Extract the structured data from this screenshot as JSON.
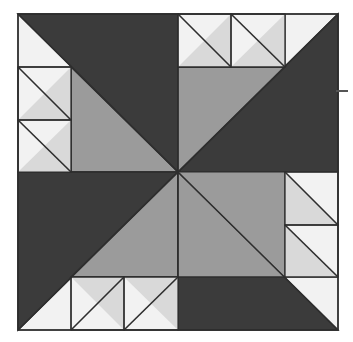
{
  "figure": {
    "type": "quilt-block-diagram",
    "canvas": {
      "width": 353,
      "height": 342,
      "background": "#ffffff"
    },
    "block": {
      "x": 18,
      "y": 14,
      "width": 320,
      "height": 316,
      "grid_rows": 4,
      "grid_cols": 4,
      "cell_width": 80,
      "cell_height": 79
    },
    "center_point": {
      "x": 178,
      "y": 172
    },
    "symmetry": "4-fold rotational (pinwheel)"
  },
  "colors": {
    "dark": "#3b3b3b",
    "medium": "#9b9b9b",
    "light": "#f2f2f2",
    "light_gray": "#d9d9d9",
    "outline": "#2e2e2e",
    "background": "#ffffff",
    "tick_mark": "#555555"
  },
  "legend": {
    "dark_label": "Dark fabric",
    "medium_label": "Medium fabric",
    "light_label": "Light fabric"
  },
  "patches": {
    "pinwheel": [
      {
        "name": "pinwheel-dark-top",
        "fill": "dark",
        "points": "18,14 178,14 178,172"
      },
      {
        "name": "pinwheel-medium-left",
        "fill": "medium",
        "points": "18,14 178,172 18,172"
      },
      {
        "name": "pinwheel-dark-right",
        "fill": "dark",
        "points": "338,14 338,172 178,172"
      },
      {
        "name": "pinwheel-medium-top-right",
        "fill": "medium",
        "points": "178,14 338,14 178,172"
      },
      {
        "name": "pinwheel-dark-left-bottom",
        "fill": "dark",
        "points": "18,172 178,172 18,330"
      },
      {
        "name": "pinwheel-medium-bottom",
        "fill": "medium",
        "points": "178,172 178,330 18,330"
      },
      {
        "name": "pinwheel-medium-right-bottom",
        "fill": "medium",
        "points": "338,172 338,330 178,172"
      },
      {
        "name": "pinwheel-dark-bottom",
        "fill": "dark",
        "points": "178,172 338,330 178,330"
      }
    ],
    "corner_units": [
      {
        "name": "hst-top-left-corner-light",
        "fill": "light",
        "points": "18,14 98,14 18,93"
      },
      {
        "name": "hst-left-upper-light",
        "fill": "light",
        "points": "18,93 98,93 18,172"
      },
      {
        "name": "hst-left-upper-accent",
        "fill": "light_gray",
        "points": "98,93 98,172 18,172"
      },
      {
        "name": "hst-left-lower-light",
        "fill": "light",
        "points": "18,172 98,172 18,251"
      },
      {
        "name": "hst-top-right-a-light",
        "fill": "light",
        "points": "178,14 258,14 178,93"
      },
      {
        "name": "hst-top-right-a-accent",
        "fill": "light_gray",
        "points": "258,14 258,93 178,93"
      },
      {
        "name": "hst-top-right-b-light",
        "fill": "light",
        "points": "258,14 338,14 258,93"
      },
      {
        "name": "hst-right-upper-light",
        "fill": "light",
        "points": "258,172 338,172 258,251"
      },
      {
        "name": "hst-right-lower-light",
        "fill": "light",
        "points": "258,251 338,251 258,330"
      },
      {
        "name": "hst-bottom-left-a-light",
        "fill": "light",
        "points": "98,251 178,330 98,330"
      },
      {
        "name": "hst-bottom-left-b-light",
        "fill": "light",
        "points": "18,251 98,330 18,330"
      }
    ]
  },
  "annotations": {
    "edge_tick": {
      "name": "right-edge-tick",
      "x": 336,
      "y": 90,
      "width": 12,
      "height": 2,
      "visible": true
    }
  }
}
